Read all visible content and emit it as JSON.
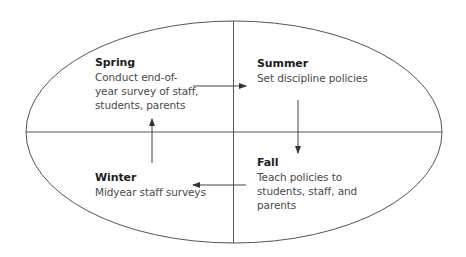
{
  "diagram": {
    "type": "cycle",
    "shape": "ellipse-divided-into-quadrants",
    "colors": {
      "stroke": "#555555",
      "title_text": "#1e1e1e",
      "body_text": "#4a4a4a",
      "background": "#ffffff"
    },
    "quadrants": [
      {
        "id": "spring",
        "position": "top-left",
        "season": "Spring",
        "description": "Conduct end-of-\nyear survey of staff,\nstudents, parents"
      },
      {
        "id": "summer",
        "position": "top-right",
        "season": "Summer",
        "description": "Set discipline policies"
      },
      {
        "id": "fall",
        "position": "bottom-right",
        "season": "Fall",
        "description": "Teach policies to\nstudents, staff, and\nparents"
      },
      {
        "id": "winter",
        "position": "bottom-left",
        "season": "Winter",
        "description": "Midyear staff surveys"
      }
    ],
    "arrows": [
      {
        "from": "Spring",
        "to": "Summer",
        "direction": "right"
      },
      {
        "from": "Summer",
        "to": "Fall",
        "direction": "down"
      },
      {
        "from": "Fall",
        "to": "Winter",
        "direction": "left"
      },
      {
        "from": "Winter",
        "to": "Spring",
        "direction": "up"
      }
    ]
  }
}
